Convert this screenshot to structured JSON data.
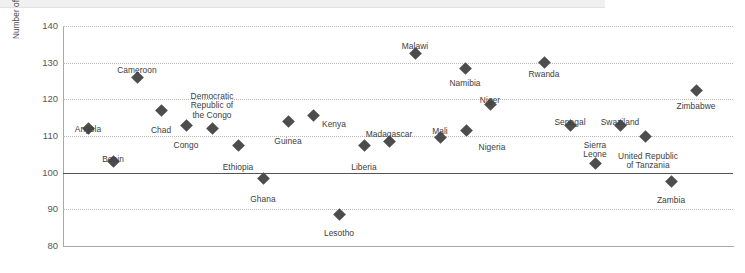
{
  "chart_data": {
    "type": "scatter",
    "title": "",
    "subtitle": "",
    "xlabel": "",
    "ylabel": "Number of women in poverty for every 100 men in poverty",
    "ylim": [
      80,
      140
    ],
    "y_ticks": [
      80,
      90,
      100,
      110,
      120,
      130,
      140
    ],
    "grid": true,
    "grid_style": "dotted horizontal",
    "reference_line": 100,
    "legend": "none",
    "marker": "diamond",
    "marker_color": "#4d4d4d",
    "categories": [
      "Angola",
      "Benin",
      "Cameroon",
      "Chad",
      "Congo",
      "Democratic Republic of the Congo",
      "Ethiopia",
      "Ghana",
      "Guinea",
      "Kenya",
      "Lesotho",
      "Liberia",
      "Madagascar",
      "Malawi",
      "Mali",
      "Namibia",
      "Niger",
      "Nigeria",
      "Rwanda",
      "Senegal",
      "Sierra Leone",
      "Swaziland",
      "United Republic of Tanzania",
      "Zambia",
      "Zimbabwe"
    ],
    "values": [
      112,
      103,
      126,
      117,
      113,
      112,
      107.5,
      98.5,
      114,
      115.5,
      88.5,
      107.5,
      108.5,
      132.5,
      109.5,
      128.5,
      118.5,
      111.5,
      130,
      113,
      102.5,
      113,
      110,
      97.5,
      122.5
    ],
    "points": [
      {
        "name": "Angola",
        "label": "Angola",
        "value": 112,
        "x_px": 88,
        "label_x": 88,
        "label_y": 125,
        "align": "c"
      },
      {
        "name": "Benin",
        "label": "Benin",
        "value": 103,
        "x_px": 113,
        "label_x": 113,
        "label_y": 155,
        "align": "c"
      },
      {
        "name": "Cameroon",
        "label": "Cameroon",
        "value": 126,
        "x_px": 137,
        "label_x": 137,
        "label_y": 66,
        "align": "c"
      },
      {
        "name": "Chad",
        "label": "Chad",
        "value": 117,
        "x_px": 161,
        "label_x": 161,
        "label_y": 126,
        "align": "c"
      },
      {
        "name": "Congo",
        "label": "Congo",
        "value": 113,
        "x_px": 186,
        "label_x": 186,
        "label_y": 141,
        "align": "c"
      },
      {
        "name": "Democratic Republic of the Congo",
        "label": "Democratic\nRepublic of\nthe Congo",
        "value": 112,
        "x_px": 212,
        "label_x": 212,
        "label_y": 92,
        "align": "c"
      },
      {
        "name": "Ethiopia",
        "label": "Ethiopia",
        "value": 107.5,
        "x_px": 238,
        "label_x": 238,
        "label_y": 163,
        "align": "c"
      },
      {
        "name": "Ghana",
        "label": "Ghana",
        "value": 98.5,
        "x_px": 263,
        "label_x": 263,
        "label_y": 195,
        "align": "c"
      },
      {
        "name": "Guinea",
        "label": "Guinea",
        "value": 114,
        "x_px": 288,
        "label_x": 288,
        "label_y": 137,
        "align": "c"
      },
      {
        "name": "Kenya",
        "label": "Kenya",
        "value": 115.5,
        "x_px": 313,
        "label_x": 322,
        "label_y": 120,
        "align": "l"
      },
      {
        "name": "Lesotho",
        "label": "Lesotho",
        "value": 88.5,
        "x_px": 339,
        "label_x": 339,
        "label_y": 229,
        "align": "c"
      },
      {
        "name": "Liberia",
        "label": "Liberia",
        "value": 107.5,
        "x_px": 364,
        "label_x": 364,
        "label_y": 163,
        "align": "c"
      },
      {
        "name": "Madagascar",
        "label": "Madagascar",
        "value": 108.5,
        "x_px": 389,
        "label_x": 389,
        "label_y": 130,
        "align": "c"
      },
      {
        "name": "Malawi",
        "label": "Malawi",
        "value": 132.5,
        "x_px": 415,
        "label_x": 415,
        "label_y": 42,
        "align": "c"
      },
      {
        "name": "Mali",
        "label": "Mali",
        "value": 109.5,
        "x_px": 440,
        "label_x": 440,
        "label_y": 127,
        "align": "c"
      },
      {
        "name": "Namibia",
        "label": "Namibia",
        "value": 128.5,
        "x_px": 465,
        "label_x": 465,
        "label_y": 79,
        "align": "c"
      },
      {
        "name": "Niger",
        "label": "Niger",
        "value": 118.5,
        "x_px": 490,
        "label_x": 490,
        "label_y": 96,
        "align": "c"
      },
      {
        "name": "Nigeria",
        "label": "Nigeria",
        "value": 111.5,
        "x_px": 466,
        "label_x": 492,
        "label_y": 143,
        "align": "c"
      },
      {
        "name": "Rwanda",
        "label": "Rwanda",
        "value": 130,
        "x_px": 544,
        "label_x": 544,
        "label_y": 70,
        "align": "c"
      },
      {
        "name": "Senegal",
        "label": "Senegal",
        "value": 113,
        "x_px": 570,
        "label_x": 570,
        "label_y": 118,
        "align": "c"
      },
      {
        "name": "Sierra Leone",
        "label": "Sierra\nLeone",
        "value": 102.5,
        "x_px": 595,
        "label_x": 595,
        "label_y": 141,
        "align": "c"
      },
      {
        "name": "Swaziland",
        "label": "Swaziland",
        "value": 113,
        "x_px": 620,
        "label_x": 620,
        "label_y": 118,
        "align": "c"
      },
      {
        "name": "United Republic of Tanzania",
        "label": "United Republic\nof Tanzania",
        "value": 110,
        "x_px": 645,
        "label_x": 648,
        "label_y": 152,
        "align": "c"
      },
      {
        "name": "Zambia",
        "label": "Zambia",
        "value": 97.5,
        "x_px": 671,
        "label_x": 671,
        "label_y": 196,
        "align": "c"
      },
      {
        "name": "Zimbabwe",
        "label": "Zimbabwe",
        "value": 122.5,
        "x_px": 696,
        "label_x": 696,
        "label_y": 102,
        "align": "c"
      }
    ]
  }
}
